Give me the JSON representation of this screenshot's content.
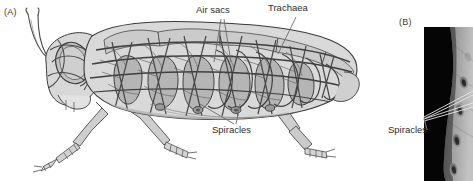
{
  "figure": {
    "type": "scientific-illustration"
  },
  "panel_a": {
    "letter": "(A)",
    "subject": "grasshopper-tracheal-system-diagram",
    "labels": [
      {
        "id": "air-sacs",
        "text": "Air sacs",
        "x": 196,
        "y": 8,
        "leaders": 2
      },
      {
        "id": "trachaea",
        "text": "Trachaea",
        "x": 268,
        "y": 5,
        "leaders": 1
      },
      {
        "id": "spiracles",
        "text": "Spiracles",
        "x": 212,
        "y": 128,
        "leaders": 2
      }
    ],
    "colors": {
      "outline": "#3a3a3a",
      "body_light": "#dcdcdc",
      "body_mid": "#b8b8b8",
      "body_dark": "#9a9a9a",
      "trachea_line": "#4a4a4a",
      "leader_line": "#6b6b6b"
    }
  },
  "panel_b": {
    "letter": "(B)",
    "subject": "spiracle-photomicrograph",
    "label": {
      "id": "spiracles-photo",
      "text": "Spiracles",
      "x": 1,
      "y": 122,
      "leaders": 2
    },
    "colors": {
      "background": "#050505",
      "cuticle_light": "#b0b0b0",
      "cuticle_mid": "#8a8a8a",
      "spiracle_dark": "#3a3a3a",
      "leader_line": "#e8e8e8"
    },
    "spiracle_count": 4
  }
}
